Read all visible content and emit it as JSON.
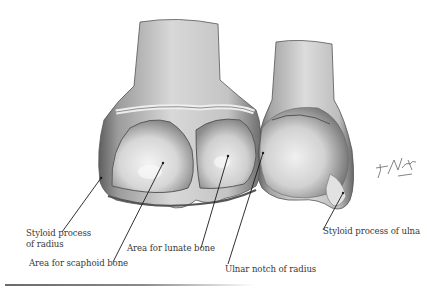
{
  "figure": {
    "signature": "F. Netter M.D.",
    "labels": [
      {
        "id": "styloid-radius",
        "lines": [
          "Styloid process",
          "of radius"
        ],
        "x": 26,
        "y": 233,
        "point": [
          101,
          178
        ],
        "anchor": [
          62,
          232
        ]
      },
      {
        "id": "scaphoid-area",
        "lines": [
          "Area for scaphoid bone"
        ],
        "x": 29,
        "y": 263,
        "point": [
          163,
          163
        ],
        "anchor": [
          113,
          262
        ]
      },
      {
        "id": "lunate-area",
        "lines": [
          "Area for lunate bone"
        ],
        "x": 127,
        "y": 242,
        "point": [
          228,
          156
        ],
        "anchor": [
          201,
          248
        ]
      },
      {
        "id": "ulnar-notch",
        "lines": [
          "Ulnar notch of radius"
        ],
        "x": 225,
        "y": 266,
        "point": [
          263,
          153
        ],
        "anchor": [
          228,
          264
        ]
      },
      {
        "id": "styloid-ulna",
        "lines": [
          "Styloid process of ulna"
        ],
        "x": 323,
        "y": 226,
        "point": [
          343,
          193
        ],
        "anchor": [
          323,
          230
        ]
      }
    ]
  },
  "colors": {
    "background": "#ffffff",
    "text": "#3a3a3a",
    "leader": "#1a1a1a"
  }
}
